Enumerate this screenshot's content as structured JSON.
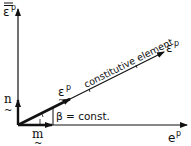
{
  "diagram": {
    "axes": {
      "vertical_label": "ε",
      "vertical_label_superscript": "p",
      "vertical_label_decoration": "double overbar",
      "horizontal_label": "e",
      "horizontal_label_superscript": "p",
      "diagonal_label": "ε",
      "diagonal_label_superscript": "p"
    },
    "diagonal_caption": "constitutive element",
    "vectors": {
      "n_label": "n",
      "m_label": "m",
      "eps_label": "ε",
      "eps_superscript": "p",
      "tilde": "~"
    },
    "angle_label": "β = const.",
    "colors": {
      "ink": "#111111",
      "background": "#ffffff"
    }
  }
}
